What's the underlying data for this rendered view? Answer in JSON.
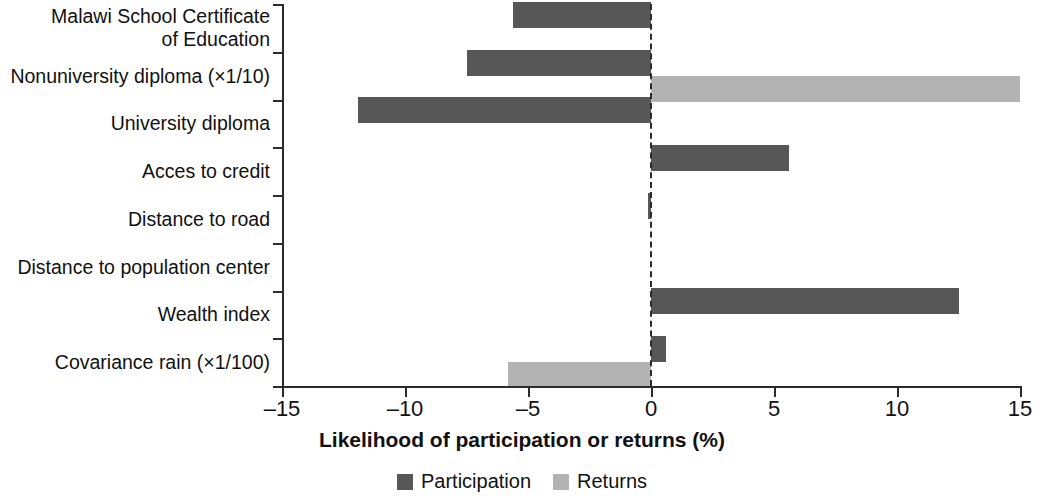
{
  "chart_data": {
    "type": "bar",
    "orientation": "horizontal",
    "title": "",
    "xlabel": "Likelihood of participation or returns (%)",
    "ylabel": "",
    "xlim": [
      -15,
      15
    ],
    "xticks": [
      -15,
      -10,
      -5,
      0,
      5,
      10,
      15
    ],
    "xtick_labels": [
      "–15",
      "–10",
      "–5",
      "0",
      "5",
      "10",
      "15"
    ],
    "grid": false,
    "zero_reference_line": true,
    "legend_position": "bottom",
    "categories": [
      "Malawi School Certificate\nof Education",
      "Nonuniversity diploma (×1/10)",
      "University diploma",
      "Acces to credit",
      "Distance to road",
      "Distance to population center",
      "Wealth index",
      "Covariance rain (×1/100)"
    ],
    "series": [
      {
        "name": "Participation",
        "color": "#575757",
        "values": [
          -5.6,
          -7.5,
          -11.9,
          5.6,
          -0.1,
          0.0,
          12.5,
          0.6
        ]
      },
      {
        "name": "Returns",
        "color": "#b3b3b3",
        "values": [
          0.0,
          15.0,
          0.0,
          0.0,
          0.0,
          0.0,
          0.0,
          -5.8
        ]
      }
    ]
  },
  "legend": {
    "entries": [
      {
        "label": "Participation",
        "color": "#575757"
      },
      {
        "label": "Returns",
        "color": "#b3b3b3"
      }
    ]
  }
}
